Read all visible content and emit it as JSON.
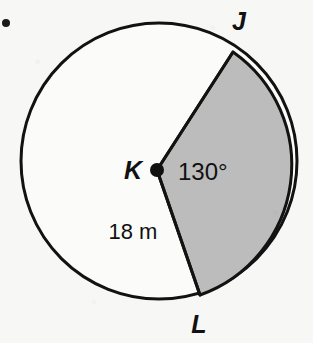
{
  "figure": {
    "name": "circle-sector-diagram",
    "background_color": "#f7f7f6",
    "circle": {
      "center_x": 159,
      "center_y": 161,
      "radius": 138,
      "stroke_color": "#121212",
      "stroke_width": 3,
      "interior_fill": "#fbfbfa"
    },
    "center_point": {
      "label": "K",
      "x": 157,
      "y": 170,
      "dot_radius": 7,
      "dot_color": "#101010",
      "label_x": 133,
      "label_y": 179
    },
    "sector": {
      "fill_color": "#bcbcbc",
      "stroke_color": "#121212",
      "stroke_width": 3,
      "start_angle_deg": -57,
      "end_angle_deg": 71,
      "angle_label": "130°",
      "angle_label_x": 178,
      "angle_label_y": 180
    },
    "radius_label": {
      "text": "18 m",
      "x": 133,
      "y": 239
    },
    "vertices": [
      {
        "label": "J",
        "point_x": 233,
        "point_y": 52,
        "label_x": 239,
        "label_y": 30
      },
      {
        "label": "L",
        "point_x": 200,
        "point_y": 295,
        "label_x": 199,
        "label_y": 333
      }
    ],
    "margin_bullet": {
      "name": "margin-bullet",
      "x": 6,
      "y": 23,
      "radius": 4,
      "color": "#1a1a1a"
    }
  },
  "chart_data": {
    "type": "pie",
    "categories": [
      "Shaded sector JKL",
      "Unshaded remainder"
    ],
    "values": [
      130,
      230
    ],
    "units": "degrees",
    "labels": {
      "center": "K",
      "arc_start": "J",
      "arc_end": "L",
      "central_angle": "130°",
      "radius": "18 m"
    },
    "radius_value": 18,
    "radius_units": "m",
    "central_angle_value": 130,
    "colors": [
      "#bcbcbc",
      "#fbfbfa"
    ],
    "legend": "none",
    "grid": false
  }
}
